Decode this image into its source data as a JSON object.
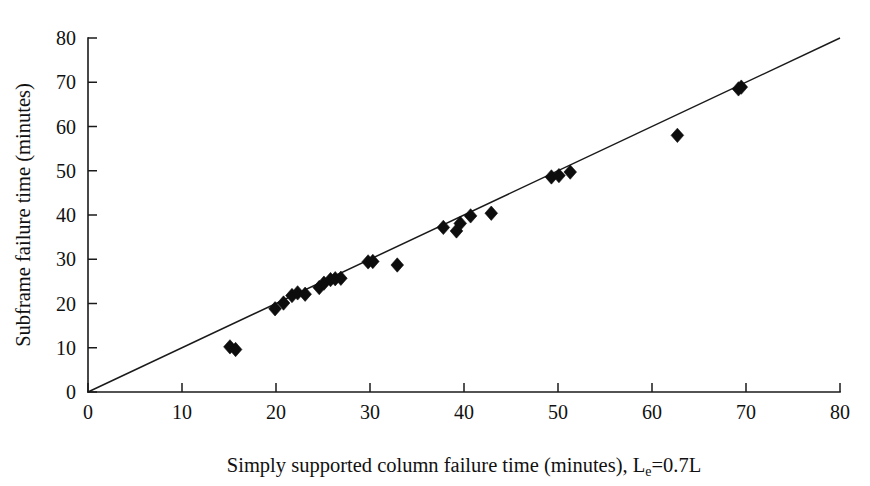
{
  "chart_data": {
    "type": "scatter",
    "title": "",
    "xlabel": "Simply supported column failure time (minutes), L",
    "xlabel_subscript": "e",
    "xlabel_suffix": "=0.7L",
    "xlabel_full": "Simply supported column failure time (minutes), Le=0.7L",
    "ylabel": "Subframe failure time (minutes)",
    "xlim": [
      0,
      80
    ],
    "ylim": [
      0,
      80
    ],
    "xticks": [
      0,
      10,
      20,
      30,
      40,
      50,
      60,
      70,
      80
    ],
    "yticks": [
      0,
      10,
      20,
      30,
      40,
      50,
      60,
      70,
      80
    ],
    "xtick_labels": [
      "0",
      "10",
      "20",
      "30",
      "40",
      "50",
      "60",
      "70",
      "80"
    ],
    "ytick_labels": [
      "0",
      "10",
      "20",
      "30",
      "40",
      "50",
      "60",
      "70",
      "80"
    ],
    "grid": false,
    "legend": null,
    "marker_style": "filled-diamond",
    "marker_color": "#0d0d0d",
    "series": [
      {
        "name": "Subframe vs simply supported column failure time",
        "marker": "diamond",
        "points": [
          [
            15.1,
            10.2
          ],
          [
            15.7,
            9.6
          ],
          [
            19.9,
            18.8
          ],
          [
            20.8,
            20.1
          ],
          [
            21.7,
            21.8
          ],
          [
            22.3,
            22.4
          ],
          [
            23.1,
            22.1
          ],
          [
            24.6,
            23.6
          ],
          [
            25.1,
            24.6
          ],
          [
            25.8,
            25.4
          ],
          [
            26.3,
            25.6
          ],
          [
            26.9,
            25.7
          ],
          [
            29.8,
            29.4
          ],
          [
            30.3,
            29.5
          ],
          [
            32.9,
            28.7
          ],
          [
            37.8,
            37.2
          ],
          [
            39.2,
            36.4
          ],
          [
            39.6,
            38.1
          ],
          [
            40.7,
            39.8
          ],
          [
            42.9,
            40.4
          ],
          [
            49.3,
            48.6
          ],
          [
            50.1,
            48.9
          ],
          [
            51.3,
            49.7
          ],
          [
            62.7,
            58.0
          ],
          [
            69.2,
            68.5
          ],
          [
            69.5,
            68.9
          ]
        ]
      }
    ],
    "reference_line": {
      "name": "equality-line",
      "from": [
        0,
        0
      ],
      "to": [
        80,
        80
      ],
      "color": "#1a1a1a"
    }
  }
}
